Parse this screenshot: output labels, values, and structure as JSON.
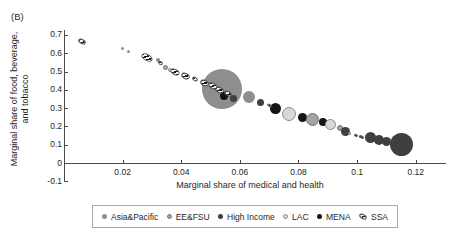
{
  "panel_label": "(B)",
  "chart_data": {
    "type": "scatter",
    "title": "",
    "xlabel": "Marginal share of medical and health",
    "ylabel": "Marginal share of food, beverage, and tobacco",
    "ylabel_line1": "Marginal share of food, beverage,",
    "ylabel_line2": "and tobacco",
    "xlim": [
      0,
      0.13
    ],
    "ylim": [
      -0.1,
      0.73
    ],
    "grid": false,
    "legend_position": "bottom",
    "x_ticks": [
      {
        "value": 0.02,
        "label": "0.02"
      },
      {
        "value": 0.04,
        "label": "0.04"
      },
      {
        "value": 0.06,
        "label": "0.06"
      },
      {
        "value": 0.08,
        "label": "0.08"
      },
      {
        "value": 0.1,
        "label": "0.1"
      },
      {
        "value": 0.12,
        "label": "0.12"
      }
    ],
    "y_ticks": [
      {
        "value": 0.7,
        "label": "0.7"
      },
      {
        "value": 0.6,
        "label": "0.6"
      },
      {
        "value": 0.5,
        "label": "0.5"
      },
      {
        "value": 0.4,
        "label": "0.4"
      },
      {
        "value": 0.3,
        "label": "0.3"
      },
      {
        "value": 0.2,
        "label": "0.2"
      },
      {
        "value": 0.1,
        "label": "0.1"
      },
      {
        "value": 0.0,
        "label": "0"
      },
      {
        "value": -0.1,
        "label": "-0.1"
      }
    ],
    "legend": [
      {
        "key": "asia",
        "label": "Asia&Pacific",
        "color": "#8e8e8e",
        "marker": "dot"
      },
      {
        "key": "eefsu",
        "label": "EE&FSU",
        "color": "#a4a4a4",
        "marker": "dot"
      },
      {
        "key": "high",
        "label": "High Income",
        "color": "#3f3f3f",
        "marker": "dot"
      },
      {
        "key": "lac",
        "label": "LAC",
        "color": "#d8d8d8",
        "marker": "dot"
      },
      {
        "key": "mena",
        "label": "MENA",
        "color": "#141414",
        "marker": "dot"
      },
      {
        "key": "ssa",
        "label": "SSA",
        "color": "hatched-black-white",
        "marker": "hatch"
      }
    ],
    "points": [
      {
        "region": "asia",
        "x": 0.054,
        "y": 0.405,
        "r": 20
      },
      {
        "region": "asia",
        "x": 0.049,
        "y": 0.432,
        "r": 6
      },
      {
        "region": "asia",
        "x": 0.063,
        "y": 0.358,
        "r": 6
      },
      {
        "region": "asia",
        "x": 0.02,
        "y": 0.628,
        "r": 1.5
      },
      {
        "region": "asia",
        "x": 0.022,
        "y": 0.607,
        "r": 1.5
      },
      {
        "region": "asia",
        "x": 0.032,
        "y": 0.562,
        "r": 2
      },
      {
        "region": "eefsu",
        "x": 0.0348,
        "y": 0.52,
        "r": 2.5
      },
      {
        "region": "lac",
        "x": 0.0362,
        "y": 0.508,
        "r": 2
      },
      {
        "region": "mena",
        "x": 0.0545,
        "y": 0.366,
        "r": 4
      },
      {
        "region": "high",
        "x": 0.058,
        "y": 0.35,
        "r": 3.5
      },
      {
        "region": "high",
        "x": 0.0669,
        "y": 0.333,
        "r": 3.5
      },
      {
        "region": "mena",
        "x": 0.072,
        "y": 0.3,
        "r": 5.5
      },
      {
        "region": "lac",
        "x": 0.0769,
        "y": 0.27,
        "r": 7
      },
      {
        "region": "mena",
        "x": 0.0814,
        "y": 0.251,
        "r": 4.5
      },
      {
        "region": "eefsu",
        "x": 0.0848,
        "y": 0.235,
        "r": 6.5
      },
      {
        "region": "mena",
        "x": 0.0883,
        "y": 0.224,
        "r": 4
      },
      {
        "region": "lac",
        "x": 0.091,
        "y": 0.208,
        "r": 5.5
      },
      {
        "region": "eefsu",
        "x": 0.094,
        "y": 0.19,
        "r": 3
      },
      {
        "region": "high",
        "x": 0.0962,
        "y": 0.17,
        "r": 4.5
      },
      {
        "region": "asia",
        "x": 0.0975,
        "y": 0.163,
        "r": 1.5
      },
      {
        "region": "high",
        "x": 0.101,
        "y": 0.147,
        "r": 1.5
      },
      {
        "region": "high",
        "x": 0.1045,
        "y": 0.138,
        "r": 5.5
      },
      {
        "region": "high",
        "x": 0.1075,
        "y": 0.127,
        "r": 5
      },
      {
        "region": "high",
        "x": 0.11,
        "y": 0.12,
        "r": 4.5
      },
      {
        "region": "high",
        "x": 0.115,
        "y": 0.1,
        "r": 11.5
      },
      {
        "region": "ssa",
        "x": 0.0062,
        "y": 0.665,
        "w": 8,
        "h": 5,
        "rot": 28
      },
      {
        "region": "ssa",
        "x": 0.0283,
        "y": 0.578,
        "w": 12,
        "h": 7,
        "rot": 28
      },
      {
        "region": "ssa",
        "x": 0.033,
        "y": 0.545,
        "w": 5,
        "h": 4,
        "rot": 28
      },
      {
        "region": "ssa",
        "x": 0.038,
        "y": 0.497,
        "w": 10,
        "h": 6,
        "rot": 28
      },
      {
        "region": "ssa",
        "x": 0.0415,
        "y": 0.475,
        "w": 9,
        "h": 6,
        "rot": 28
      },
      {
        "region": "ssa",
        "x": 0.0447,
        "y": 0.46,
        "w": 6,
        "h": 4,
        "rot": 28
      },
      {
        "region": "ssa",
        "x": 0.048,
        "y": 0.438,
        "w": 9,
        "h": 6,
        "rot": 28
      },
      {
        "region": "ssa",
        "x": 0.051,
        "y": 0.42,
        "w": 10,
        "h": 6,
        "rot": 28
      },
      {
        "region": "ssa",
        "x": 0.0532,
        "y": 0.4,
        "w": 9,
        "h": 6,
        "rot": 28
      },
      {
        "region": "ssa",
        "x": 0.056,
        "y": 0.378,
        "w": 8,
        "h": 5,
        "rot": 28
      },
      {
        "region": "ssa",
        "x": 0.07,
        "y": 0.312,
        "w": 5,
        "h": 3,
        "rot": 28
      },
      {
        "region": "ssa",
        "x": 0.0995,
        "y": 0.152,
        "w": 4,
        "h": 3,
        "rot": 28
      },
      {
        "region": "ssa",
        "x": 0.102,
        "y": 0.143,
        "w": 3,
        "h": 2.5,
        "rot": 28
      }
    ]
  },
  "colors": {
    "asia_pacific": "#8e8e8e",
    "ee_fsu": "#a4a4a4",
    "high_income": "#3f3f3f",
    "lac": "#d8d8d8",
    "mena": "#141414",
    "ssa_stripe": "#1c1c1c",
    "axis": "#4a4a4a"
  }
}
